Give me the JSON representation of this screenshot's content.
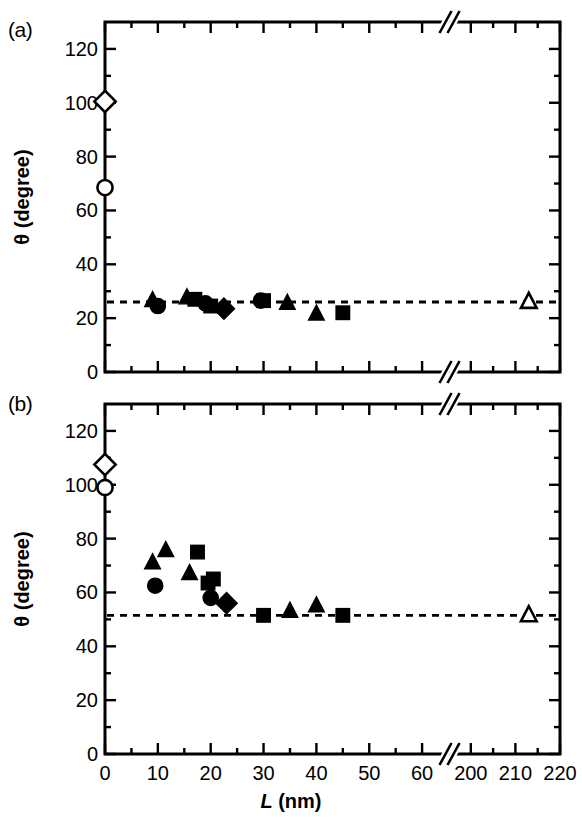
{
  "figure": {
    "panel_a_tag": "(a)",
    "panel_b_tag": "(b)",
    "y_axis_title_plain": "θ (degree)",
    "x_axis_title_italic": "L",
    "x_axis_title_rest": " (nm)"
  },
  "chart_data": [
    {
      "type": "scatter",
      "panel": "(a)",
      "title": "",
      "xlabel": "L (nm)",
      "ylabel": "θ (degree)",
      "xlim": [
        0,
        220
      ],
      "ylim": [
        0,
        130
      ],
      "x_axis_break": {
        "present": true,
        "break_between": [
          65,
          195
        ]
      },
      "x_ticks_major": [
        0,
        10,
        20,
        30,
        40,
        50,
        60,
        200,
        210,
        220
      ],
      "x_ticks_major_labels": [
        "0",
        "10",
        "20",
        "30",
        "40",
        "50",
        "60",
        "200",
        "210",
        "220"
      ],
      "x_ticks_minor": [
        5,
        15,
        25,
        35,
        45,
        55,
        205,
        215
      ],
      "y_ticks_major": [
        0,
        20,
        40,
        60,
        80,
        100,
        120
      ],
      "y_ticks_major_labels": [
        "0",
        "20",
        "40",
        "60",
        "80",
        "100",
        "120"
      ],
      "y_ticks_minor": [
        10,
        30,
        50,
        70,
        90,
        110
      ],
      "grid": false,
      "legend": "none",
      "reference_line": {
        "style": "dashed",
        "y": 26.0
      },
      "series": [
        {
          "name": "open-diamond",
          "marker": "diamond",
          "fill": "open",
          "points": [
            {
              "x": 0,
              "y": 100.5
            }
          ]
        },
        {
          "name": "open-circle",
          "marker": "circle",
          "fill": "open",
          "points": [
            {
              "x": 0,
              "y": 68.5
            }
          ]
        },
        {
          "name": "open-triangle",
          "marker": "triangle",
          "fill": "open",
          "points": [
            {
              "x": 213,
              "y": 26.0
            }
          ]
        },
        {
          "name": "filled-triangle",
          "marker": "triangle",
          "fill": "filled",
          "points": [
            {
              "x": 9.0,
              "y": 26.5
            },
            {
              "x": 15.5,
              "y": 27.5
            },
            {
              "x": 34.5,
              "y": 25.5
            },
            {
              "x": 40.0,
              "y": 21.5
            }
          ]
        },
        {
          "name": "filled-square",
          "marker": "square",
          "fill": "filled",
          "points": [
            {
              "x": 17.0,
              "y": 27.0
            },
            {
              "x": 20.0,
              "y": 24.5
            },
            {
              "x": 30.0,
              "y": 26.5
            },
            {
              "x": 45.0,
              "y": 22.0
            }
          ]
        },
        {
          "name": "filled-circle",
          "marker": "circle",
          "fill": "filled",
          "points": [
            {
              "x": 10.0,
              "y": 24.5
            },
            {
              "x": 19.0,
              "y": 25.5
            },
            {
              "x": 29.5,
              "y": 26.5
            }
          ]
        },
        {
          "name": "filled-diamond",
          "marker": "diamond",
          "fill": "filled",
          "points": [
            {
              "x": 22.5,
              "y": 23.5
            }
          ]
        }
      ]
    },
    {
      "type": "scatter",
      "panel": "(b)",
      "title": "",
      "xlabel": "L (nm)",
      "ylabel": "θ (degree)",
      "xlim": [
        0,
        220
      ],
      "ylim": [
        0,
        130
      ],
      "x_axis_break": {
        "present": true,
        "break_between": [
          65,
          195
        ]
      },
      "x_ticks_major": [
        0,
        10,
        20,
        30,
        40,
        50,
        60,
        200,
        210,
        220
      ],
      "x_ticks_major_labels": [
        "0",
        "10",
        "20",
        "30",
        "40",
        "50",
        "60",
        "200",
        "210",
        "220"
      ],
      "x_ticks_minor": [
        5,
        15,
        25,
        35,
        45,
        55,
        205,
        215
      ],
      "y_ticks_major": [
        0,
        20,
        40,
        60,
        80,
        100,
        120
      ],
      "y_ticks_major_labels": [
        "0",
        "20",
        "40",
        "60",
        "80",
        "100",
        "120"
      ],
      "y_ticks_minor": [
        10,
        30,
        50,
        70,
        90,
        110
      ],
      "grid": false,
      "legend": "none",
      "reference_line": {
        "style": "dashed",
        "y": 51.5
      },
      "series": [
        {
          "name": "open-diamond",
          "marker": "diamond",
          "fill": "open",
          "points": [
            {
              "x": 0,
              "y": 107.5
            }
          ]
        },
        {
          "name": "open-circle",
          "marker": "circle",
          "fill": "open",
          "points": [
            {
              "x": 0,
              "y": 99.0
            }
          ]
        },
        {
          "name": "open-triangle",
          "marker": "triangle",
          "fill": "open",
          "points": [
            {
              "x": 213,
              "y": 51.5
            }
          ]
        },
        {
          "name": "filled-triangle",
          "marker": "triangle",
          "fill": "filled",
          "points": [
            {
              "x": 9.0,
              "y": 71.0
            },
            {
              "x": 11.5,
              "y": 75.5
            },
            {
              "x": 16.0,
              "y": 67.0
            },
            {
              "x": 35.0,
              "y": 53.0
            },
            {
              "x": 40.0,
              "y": 55.0
            }
          ]
        },
        {
          "name": "filled-square",
          "marker": "square",
          "fill": "filled",
          "points": [
            {
              "x": 17.5,
              "y": 75.0
            },
            {
              "x": 20.5,
              "y": 65.0
            },
            {
              "x": 19.5,
              "y": 63.5
            },
            {
              "x": 30.0,
              "y": 51.5
            },
            {
              "x": 45.0,
              "y": 51.5
            }
          ]
        },
        {
          "name": "filled-circle",
          "marker": "circle",
          "fill": "filled",
          "points": [
            {
              "x": 9.5,
              "y": 62.5
            },
            {
              "x": 20.0,
              "y": 58.0
            }
          ]
        },
        {
          "name": "filled-diamond",
          "marker": "diamond",
          "fill": "filled",
          "points": [
            {
              "x": 23.0,
              "y": 56.0
            }
          ]
        }
      ]
    }
  ]
}
